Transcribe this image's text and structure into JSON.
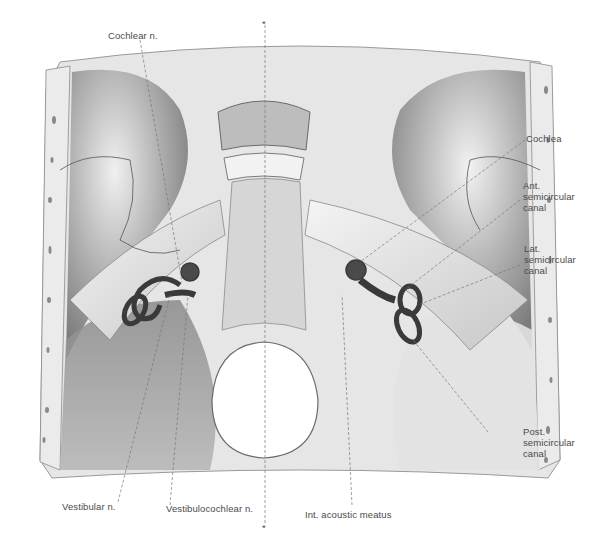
{
  "figure": {
    "midline_marker": "*",
    "colors": {
      "background": "#ffffff",
      "bone_light": "#ececec",
      "bone_mid": "#b8b8b8",
      "bone_dark": "#6e6e6e",
      "labyrinth": "#3a3a3a",
      "label_text": "#4a4a4a",
      "leader_line": "#777777"
    }
  },
  "labels": {
    "cochlear_n": "Cochlear n.",
    "cochlea": "Cochlea",
    "ant_semicircular_canal": "Ant.\nsemicircular\ncanal",
    "lat_semicircular_canal": "Lat.\nsemicircular\ncanal",
    "post_semicircular_canal": "Post.\nsemicircular\ncanal",
    "vestibular_n": "Vestibular n.",
    "vestibulocochlear_n": "Vestibulocochlear n.",
    "int_acoustic_meatus": "Int. acoustic meatus",
    "midline_top": "*",
    "midline_bottom": "*"
  }
}
